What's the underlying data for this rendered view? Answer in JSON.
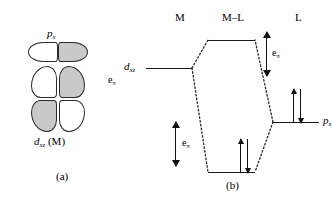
{
  "figure": {
    "panel_a": {
      "caption": "(a)",
      "orbital_top": {
        "symbol": "p",
        "subscript": "x",
        "name": "p-x-orbital"
      },
      "orbital_bottom": {
        "symbol": "d",
        "subscript": "xz",
        "suffix": " (M)",
        "name": "d-xz-metal-orbital"
      },
      "interaction_label": {
        "symbol": "e",
        "subscript": "π"
      },
      "lobe_colors": {
        "filled": "#c9c9c9",
        "empty": "#ffffff",
        "outline": "#2b2b2b"
      },
      "lobe_phases": {
        "p_left": "empty",
        "p_right": "filled",
        "d_upper_left": "empty",
        "d_upper_right": "filled",
        "d_lower_left": "filled",
        "d_lower_right": "empty"
      }
    },
    "panel_b": {
      "caption": "(b)",
      "columns": [
        {
          "label": "M",
          "name": "column-metal"
        },
        {
          "label": "M–L",
          "name": "column-metal-ligand"
        },
        {
          "label": "L",
          "name": "column-ligand"
        }
      ],
      "levels": [
        {
          "id": "dxz",
          "symbol": "d",
          "subscript": "xz",
          "column": "M",
          "electrons": 0
        },
        {
          "id": "antibonding",
          "symbol": "",
          "subscript": "",
          "column": "M-L",
          "electrons": 0
        },
        {
          "id": "bonding",
          "symbol": "",
          "subscript": "",
          "column": "M-L",
          "electrons": 2
        },
        {
          "id": "px",
          "symbol": "p",
          "subscript": "x",
          "column": "L",
          "electrons": 2
        }
      ],
      "gap_arrows": [
        {
          "id": "gap-left",
          "symbol": "e",
          "subscript": "π"
        },
        {
          "id": "gap-right",
          "symbol": "e",
          "subscript": "π"
        }
      ]
    }
  }
}
